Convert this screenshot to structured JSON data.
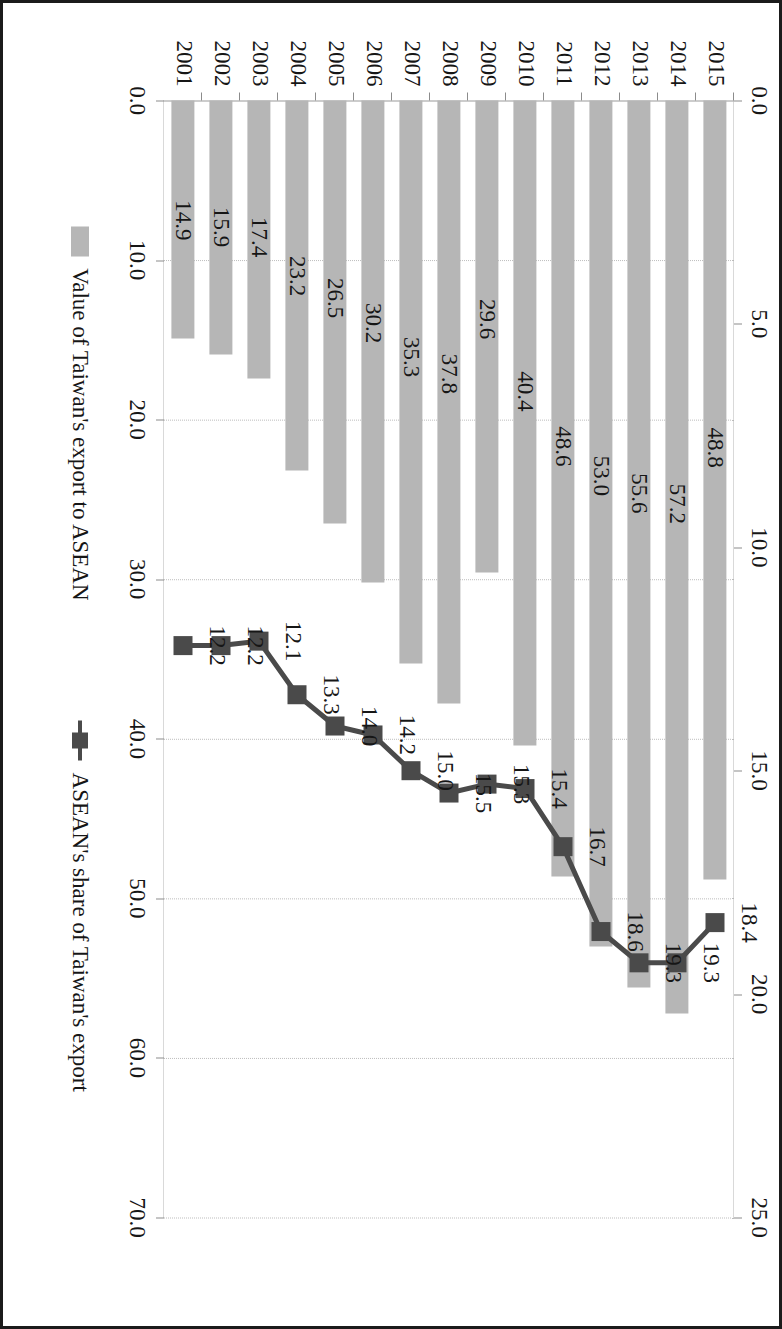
{
  "chart_data": {
    "type": "bar",
    "title": "",
    "subtitle": "",
    "xlabel": "",
    "ylabel": "",
    "y2label": "",
    "grid": true,
    "legend_position": "bottom",
    "orientation": "rotated-90-clockwise",
    "categories": [
      "2001",
      "2002",
      "2003",
      "2004",
      "2005",
      "2006",
      "2007",
      "2008",
      "2009",
      "2010",
      "2011",
      "2012",
      "2013",
      "2014",
      "2015"
    ],
    "ylim": [
      0.0,
      70.0
    ],
    "y2lim": [
      0.0,
      25.0
    ],
    "ytick_labels": [
      "0.0",
      "10.0",
      "20.0",
      "30.0",
      "40.0",
      "50.0",
      "60.0",
      "70.0"
    ],
    "ytick_values": [
      0.0,
      10.0,
      20.0,
      30.0,
      40.0,
      50.0,
      60.0,
      70.0
    ],
    "y2tick_labels": [
      "0.0",
      "5.0",
      "10.0",
      "15.0",
      "20.0",
      "25.0"
    ],
    "y2tick_values": [
      0.0,
      5.0,
      10.0,
      15.0,
      20.0,
      25.0
    ],
    "series": [
      {
        "name": "Value of Taiwan's export to ASEAN",
        "type": "bar",
        "axis": "primary",
        "color": "#b6b6b6",
        "values": [
          14.9,
          15.9,
          17.4,
          23.2,
          26.5,
          30.2,
          35.3,
          37.8,
          29.6,
          40.4,
          48.6,
          53.0,
          55.6,
          57.2,
          48.8
        ],
        "labels": [
          "14.9",
          "15.9",
          "17.4",
          "23.2",
          "26.5",
          "30.2",
          "35.3",
          "37.8",
          "29.6",
          "40.4",
          "48.6",
          "53.0",
          "55.6",
          "57.2",
          "48.8"
        ]
      },
      {
        "name": "ASEAN's share of Taiwan's export",
        "type": "line",
        "axis": "secondary",
        "color": "#4a4a4a",
        "values": [
          12.2,
          12.2,
          12.1,
          13.3,
          14.0,
          14.2,
          15.0,
          15.5,
          15.3,
          15.4,
          16.7,
          18.6,
          19.3,
          19.3,
          18.4
        ],
        "labels": [
          "12.2",
          "12.2",
          "12.1",
          "13.3",
          "14.0",
          "14.2",
          "15.0",
          "15.5",
          "15.3",
          "15.4",
          "16.7",
          "18.6",
          "19.3",
          "19.3",
          "18.4"
        ]
      }
    ]
  },
  "legend": {
    "items": [
      {
        "label": "Value of Taiwan's export to ASEAN",
        "marker": "bar-swatch",
        "color": "#b6b6b6"
      },
      {
        "label": "ASEAN's share of Taiwan's export",
        "marker": "line-square-marker",
        "color": "#4a4a4a"
      }
    ]
  },
  "colors": {
    "bar": "#b6b6b6",
    "line": "#4a4a4a",
    "text": "#161616",
    "grid": "#bdbdbd",
    "frame": "#1b1b1b",
    "background": "#ffffff"
  }
}
